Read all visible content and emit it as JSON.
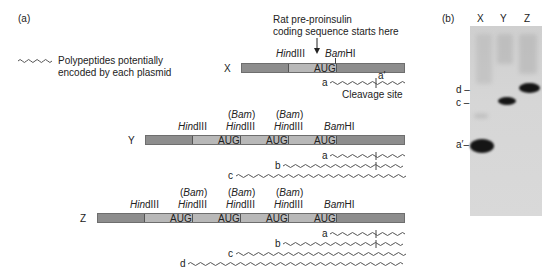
{
  "panel_a": {
    "label": "(a)",
    "legend": {
      "icon": "wavy-line-icon",
      "line1": "Polypeptides potentially",
      "line2": "encoded by each plasmid"
    },
    "annotation": {
      "line1": "Rat pre-proinsulin",
      "line2": "coding sequence starts here",
      "arrow": "down-arrow-icon"
    },
    "constructs": [
      {
        "name": "X",
        "sites": [
          {
            "top": "",
            "main_italic": "Hin",
            "main_rest": "dIII"
          },
          {
            "top": "",
            "main_italic": "Bam",
            "main_rest": "HI"
          }
        ],
        "aug_label": "AUG",
        "polypeptides": [
          "a"
        ],
        "cleavage_label": "a′",
        "cleavage_text": "Cleavage site"
      },
      {
        "name": "Y",
        "sites": [
          {
            "top": "",
            "main_italic": "Hin",
            "main_rest": "dIII"
          },
          {
            "top_open": "(",
            "top_italic": "Bam",
            "top_close": ")",
            "main_italic": "Hin",
            "main_rest": "dIII"
          },
          {
            "top_open": "(",
            "top_italic": "Bam",
            "top_close": ")",
            "main_italic": "Hin",
            "main_rest": "dIII"
          },
          {
            "top": "",
            "main_italic": "Bam",
            "main_rest": "HI"
          }
        ],
        "aug_label": "AUG",
        "polypeptides": [
          "a",
          "b",
          "c"
        ]
      },
      {
        "name": "Z",
        "sites": [
          {
            "top": "",
            "main_italic": "Hin",
            "main_rest": "dIII"
          },
          {
            "top_open": "(",
            "top_italic": "Bam",
            "top_close": ")",
            "main_italic": "Hin",
            "main_rest": "dIII"
          },
          {
            "top_open": "(",
            "top_italic": "Bam",
            "top_close": ")",
            "main_italic": "Hin",
            "main_rest": "dIII"
          },
          {
            "top_open": "(",
            "top_italic": "Bam",
            "top_close": ")",
            "main_italic": "Hin",
            "main_rest": "dIII"
          },
          {
            "top": "",
            "main_italic": "Bam",
            "main_rest": "HI"
          }
        ],
        "aug_label": "AUG",
        "polypeptides": [
          "a",
          "b",
          "c",
          "d"
        ]
      }
    ]
  },
  "panel_b": {
    "label": "(b)",
    "lanes": [
      "X",
      "Y",
      "Z"
    ],
    "markers": [
      "d",
      "c",
      "a′"
    ],
    "dash": "–"
  }
}
